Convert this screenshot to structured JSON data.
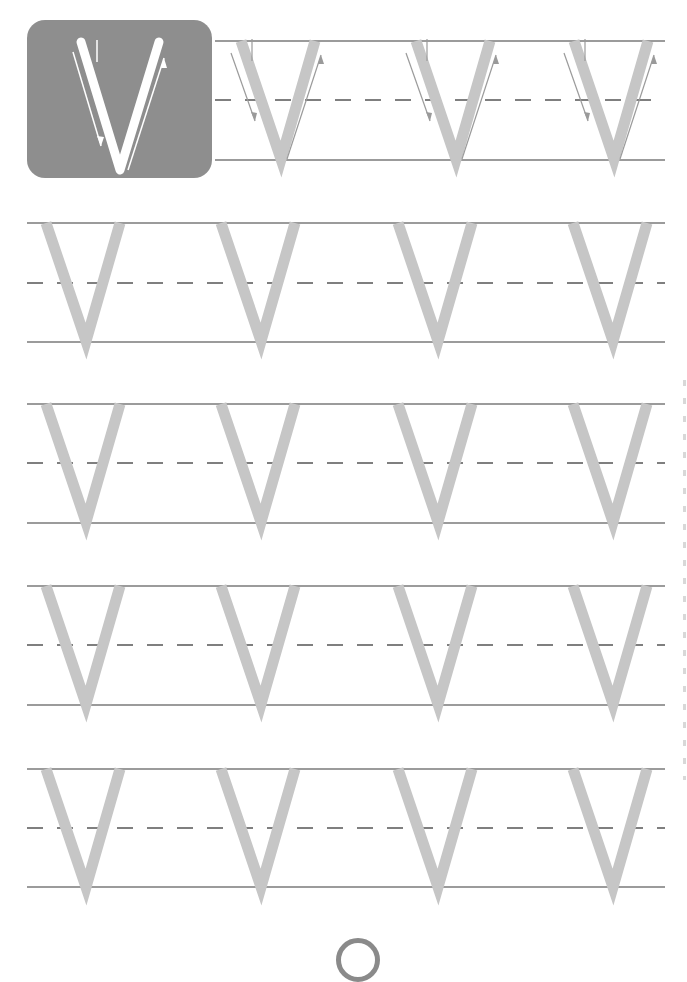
{
  "worksheet": {
    "letter": "V",
    "type": "letter-tracing",
    "model_box": {
      "letter": "V",
      "background": "#8e8e8e",
      "letter_color": "#ffffff"
    },
    "colors": {
      "guide_line": "#7a7a7a",
      "trace_letter": "#c6c6c6",
      "arrow": "#9a9a9a"
    },
    "rows": [
      {
        "index": 1,
        "top": 41,
        "mid": 100,
        "bottom": 160,
        "x_start": 215,
        "letters_x": [
          235,
          410,
          568
        ],
        "with_arrows": true
      },
      {
        "index": 2,
        "top": 223,
        "mid": 283,
        "bottom": 342,
        "x_start": 27,
        "letters_x": [
          40,
          215,
          392,
          567
        ],
        "with_arrows": false
      },
      {
        "index": 3,
        "top": 404,
        "mid": 463,
        "bottom": 523,
        "x_start": 27,
        "letters_x": [
          40,
          215,
          392,
          567
        ],
        "with_arrows": false
      },
      {
        "index": 4,
        "top": 586,
        "mid": 645,
        "bottom": 705,
        "x_start": 27,
        "letters_x": [
          40,
          215,
          392,
          567
        ],
        "with_arrows": false
      },
      {
        "index": 5,
        "top": 769,
        "mid": 828,
        "bottom": 887,
        "x_start": 27,
        "letters_x": [
          40,
          215,
          392,
          567
        ],
        "with_arrows": false
      }
    ],
    "page_number": ""
  }
}
